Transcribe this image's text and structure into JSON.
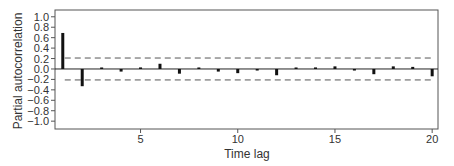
{
  "chart_data": {
    "type": "bar",
    "subtype": "partial-autocorrelation-stem",
    "title": "",
    "xlabel": "Time lag",
    "ylabel": "Partial autocorrelation",
    "x": [
      1,
      2,
      3,
      4,
      5,
      6,
      7,
      8,
      9,
      10,
      11,
      12,
      13,
      14,
      15,
      16,
      17,
      18,
      19,
      20
    ],
    "values": [
      0.69,
      -0.33,
      0.01,
      -0.05,
      0.03,
      0.1,
      -0.09,
      0.02,
      -0.05,
      -0.08,
      -0.03,
      -0.12,
      0.01,
      0.03,
      0.05,
      -0.03,
      -0.1,
      0.05,
      0.04,
      -0.14
    ],
    "confidence_bounds": [
      0.21,
      -0.21
    ],
    "xlim": [
      0.6,
      20.3
    ],
    "ylim": [
      -1.15,
      1.13
    ],
    "xticks": [
      5,
      10,
      15,
      20
    ],
    "xtick_labels": [
      "5",
      "10",
      "15",
      "20"
    ],
    "yticks": [
      1.0,
      0.8,
      0.6,
      0.4,
      0.2,
      0.0,
      -0.2,
      -0.4,
      -0.6,
      -0.8,
      -1.0
    ],
    "ytick_labels": [
      "1.0",
      "0.8",
      "0.6",
      "0.4",
      "0.2",
      "0.0",
      "−0.2",
      "−0.4",
      "−0.6",
      "−0.8",
      "−1.0"
    ],
    "grid": false,
    "legend": null,
    "colors": {
      "bars": "#111111",
      "axes": "#555555",
      "zero_line": "#222222",
      "bounds": "#555555",
      "text": "#333333"
    }
  },
  "labels": {
    "xlabel": "Time lag",
    "ylabel": "Partial autocorrelation"
  }
}
